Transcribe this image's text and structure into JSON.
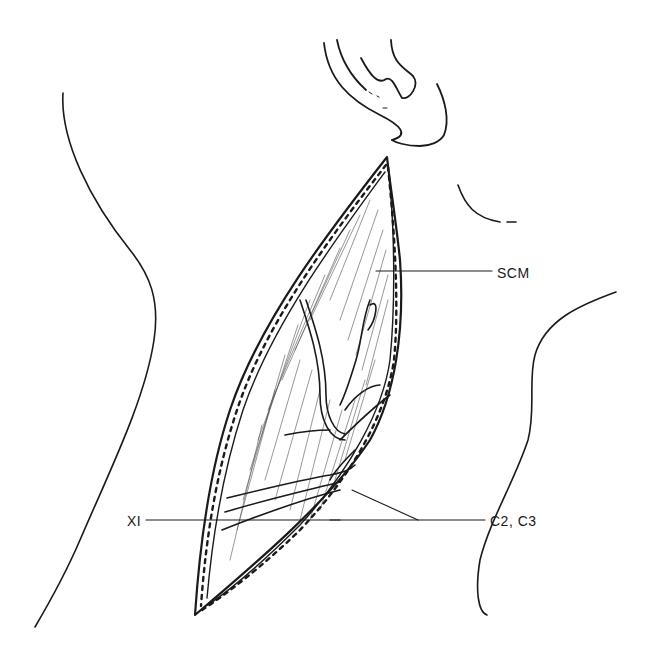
{
  "figure": {
    "colors": {
      "ink": "#1a1a1a",
      "background": "#ffffff"
    },
    "labels": {
      "scm": "SCM",
      "xi": "XI",
      "c2_c3": "C2, C3"
    },
    "structures": [
      "ear-outline",
      "neck-outline-left",
      "neck-outline-right",
      "jaw-angle-outline",
      "incision-wound",
      "sternocleidomastoid-muscle",
      "accessory-nerve",
      "cervical-nerves"
    ]
  }
}
